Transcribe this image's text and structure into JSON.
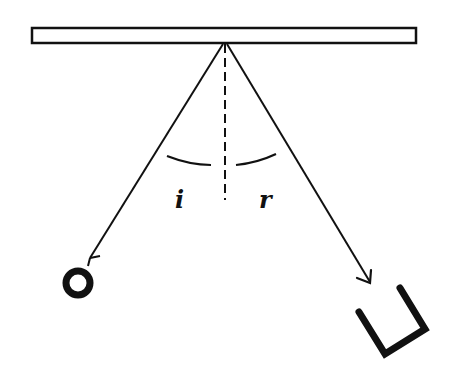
{
  "diagram": {
    "labels": {
      "incidence_angle": "i",
      "reflection_angle": "r"
    },
    "elements": [
      {
        "name": "mirror",
        "type": "rectangle"
      },
      {
        "name": "normal",
        "type": "dashed-line"
      },
      {
        "name": "incident-ray",
        "type": "line-with-arrow"
      },
      {
        "name": "reflected-ray",
        "type": "line-with-arrow"
      },
      {
        "name": "source-ring",
        "type": "ring"
      },
      {
        "name": "receiver",
        "type": "u-shape"
      }
    ],
    "colors": {
      "ink": "#111111",
      "background": "#ffffff"
    }
  }
}
